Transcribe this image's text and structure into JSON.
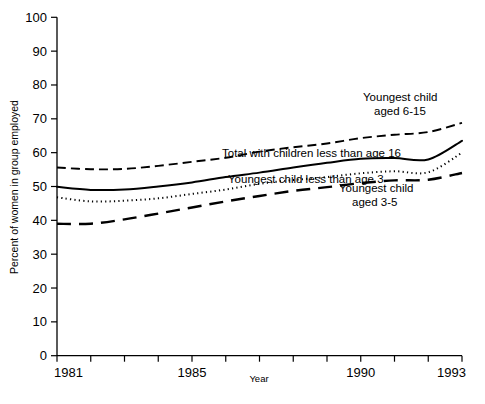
{
  "chart_data": {
    "type": "line",
    "title": "",
    "xlabel": "Year",
    "ylabel": "Percent of women in group employed",
    "xlim": [
      1981,
      1993
    ],
    "ylim": [
      0,
      100
    ],
    "grid": false,
    "legend_position": "inline-annotations",
    "x": [
      1981,
      1982,
      1983,
      1984,
      1985,
      1986,
      1987,
      1988,
      1989,
      1990,
      1991,
      1992,
      1993
    ],
    "xticks": [
      1981,
      1982,
      1983,
      1984,
      1985,
      1986,
      1987,
      1988,
      1989,
      1990,
      1991,
      1992,
      1993
    ],
    "xtick_labels": [
      "1981",
      "",
      "",
      "",
      "1985",
      "",
      "",
      "",
      "",
      "1990",
      "",
      "",
      "1993"
    ],
    "yticks": [
      0,
      10,
      20,
      30,
      40,
      50,
      60,
      70,
      80,
      90,
      100
    ],
    "ytick_labels": [
      "0",
      "10",
      "20",
      "30",
      "40",
      "50",
      "60",
      "70",
      "80",
      "90",
      "100"
    ],
    "series": [
      {
        "name": "Youngest child aged 6-15",
        "label": "Youngest child\naged 6-15",
        "label_line1": "Youngest child",
        "label_line2": "aged 6-15",
        "style": "dashed",
        "values": [
          55.6,
          55.1,
          55.2,
          56.1,
          57.3,
          58.5,
          60.3,
          61.6,
          62.7,
          64.3,
          65.3,
          66.1,
          68.8
        ]
      },
      {
        "name": "Total with children less than age 16",
        "label": "Total with children less than age 16",
        "style": "solid",
        "values": [
          49.9,
          49.0,
          49.1,
          50.0,
          51.2,
          52.8,
          54.1,
          55.6,
          57.0,
          58.2,
          58.4,
          58.0,
          63.5
        ]
      },
      {
        "name": "Youngest child less than age 3",
        "label": "Youngest child less than age 3",
        "style": "dotted",
        "values": [
          46.8,
          45.6,
          45.8,
          46.5,
          47.8,
          49.1,
          50.8,
          51.9,
          52.8,
          53.9,
          54.5,
          54.2,
          60.0
        ]
      },
      {
        "name": "Youngest child aged 3-5",
        "label": "Youngest child\naged 3-5",
        "label_line1": "Youngest child",
        "label_line2": "aged 3-5",
        "style": "long-dashed",
        "values": [
          39.0,
          39.0,
          40.3,
          42.0,
          43.8,
          45.6,
          47.2,
          48.7,
          49.8,
          51.0,
          51.8,
          52.0,
          54.0
        ]
      }
    ],
    "annotations": [
      {
        "text": "Youngest child",
        "x": 363,
        "y": 101
      },
      {
        "text": "aged 6-15",
        "x": 374,
        "y": 115
      },
      {
        "text": "Total with children less than age 16",
        "x": 222,
        "y": 157
      },
      {
        "text": "Youngest child less than age 3",
        "x": 228,
        "y": 183
      },
      {
        "text": "Youngest child",
        "x": 339,
        "y": 192
      },
      {
        "text": "aged 3-5",
        "x": 352,
        "y": 206
      }
    ]
  },
  "axes": {
    "y_title": "Percent of women in group employed",
    "x_title": "Year"
  },
  "colors": {
    "ink": "#000000",
    "background": "#ffffff"
  }
}
